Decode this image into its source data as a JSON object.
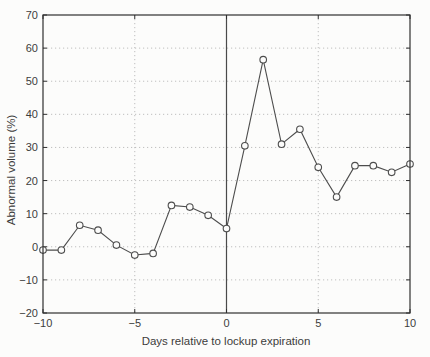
{
  "chart_data": {
    "type": "line",
    "title": "",
    "xlabel": "Days relative to lockup expiration",
    "ylabel": "Abnormal volume (%)",
    "x": [
      -10,
      -9,
      -8,
      -7,
      -6,
      -5,
      -4,
      -3,
      -2,
      -1,
      0,
      1,
      2,
      3,
      4,
      5,
      6,
      7,
      8,
      9,
      10
    ],
    "y": [
      -1,
      -1,
      6.5,
      5,
      0.5,
      -2.5,
      -2,
      12.5,
      12,
      9.5,
      5.5,
      30.5,
      56.5,
      31,
      35.5,
      24,
      15,
      24.5,
      24.5,
      22.5,
      25
    ],
    "xlim": [
      -10,
      10
    ],
    "ylim": [
      -20,
      70
    ],
    "xticks": [
      -10,
      -5,
      0,
      5,
      10
    ],
    "yticks": [
      -20,
      -10,
      0,
      10,
      20,
      30,
      40,
      50,
      60,
      70
    ],
    "grid": true,
    "grid_style": "dotted",
    "marker": "open-circle",
    "vline_at_x": 0,
    "legend": "none",
    "colors": {
      "line": "#4d4d4d",
      "marker_stroke": "#4d4d4d",
      "marker_fill": "#fcfcfb",
      "grid": "#b8b8b8",
      "zero_line": "#4a4a4a",
      "border": "#2f2f2f",
      "text": "#3c3c3c",
      "background": "#fcfcfb"
    }
  }
}
